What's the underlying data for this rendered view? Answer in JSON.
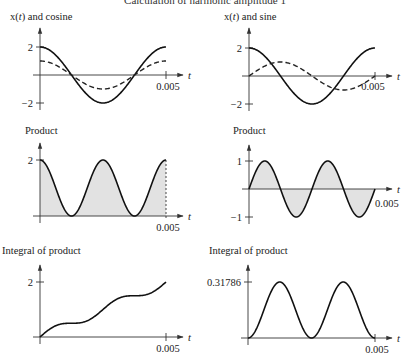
{
  "title": "Calculation of harmonic amplitude 1",
  "chart_data": [
    {
      "id": "xcos",
      "type": "line",
      "title": "x(t) and cosine",
      "xlabel": "t",
      "x_tick": "0.005",
      "y_ticks": [
        "2",
        "−2"
      ],
      "xlim": [
        0,
        0.005
      ],
      "ylim": [
        -2,
        2
      ],
      "series": [
        {
          "name": "x(t)",
          "style": "solid",
          "formula": "2cos(2πt/0.005)",
          "x": [
            0,
            0.00125,
            0.0025,
            0.00375,
            0.005
          ],
          "values": [
            2,
            0,
            -2,
            0,
            2
          ]
        },
        {
          "name": "cosine",
          "style": "dashed",
          "formula": "cos(2πt/0.005)",
          "x": [
            0,
            0.00125,
            0.0025,
            0.00375,
            0.005
          ],
          "values": [
            1,
            0,
            -1,
            0,
            1
          ]
        }
      ]
    },
    {
      "id": "xsin",
      "type": "line",
      "title": "x(t) and sine",
      "xlabel": "t",
      "x_tick": "0.005",
      "y_ticks": [
        "2",
        "−2"
      ],
      "xlim": [
        0,
        0.005
      ],
      "ylim": [
        -2,
        2
      ],
      "series": [
        {
          "name": "x(t)",
          "style": "solid",
          "formula": "2cos(2πt/0.005)",
          "x": [
            0,
            0.00125,
            0.0025,
            0.00375,
            0.005
          ],
          "values": [
            2,
            0,
            -2,
            0,
            2
          ]
        },
        {
          "name": "sine",
          "style": "dashed",
          "formula": "sin(2πt/0.005)",
          "x": [
            0,
            0.00125,
            0.0025,
            0.00375,
            0.005
          ],
          "values": [
            0,
            1,
            0,
            -1,
            0
          ]
        }
      ]
    },
    {
      "id": "prodcos",
      "type": "area",
      "title": "Product",
      "xlabel": "t",
      "x_tick": "0.005",
      "y_ticks": [
        "2"
      ],
      "xlim": [
        0,
        0.005
      ],
      "ylim": [
        0,
        2
      ],
      "series": [
        {
          "name": "x(t)·cosine",
          "formula": "2cos²(2πt/0.005)",
          "x": [
            0,
            0.00125,
            0.0025,
            0.00375,
            0.005
          ],
          "values": [
            2,
            0,
            2,
            0,
            2
          ]
        }
      ]
    },
    {
      "id": "prodsin",
      "type": "area",
      "title": "Product",
      "xlabel": "t",
      "x_tick": "0.005",
      "y_ticks": [
        "1",
        "−1"
      ],
      "xlim": [
        0,
        0.005
      ],
      "ylim": [
        -1,
        1
      ],
      "series": [
        {
          "name": "x(t)·sine",
          "formula": "sin(4πt/0.005)",
          "x": [
            0,
            0.000625,
            0.00125,
            0.001875,
            0.0025,
            0.003125,
            0.00375,
            0.004375,
            0.005
          ],
          "values": [
            0,
            1,
            0,
            -1,
            0,
            1,
            0,
            -1,
            0
          ]
        }
      ]
    },
    {
      "id": "intcos",
      "type": "line",
      "title": "Integral of product",
      "xlabel": "t",
      "x_tick": "0.005",
      "y_ticks": [
        "2"
      ],
      "xlim": [
        0,
        0.005
      ],
      "ylim": [
        0,
        2
      ],
      "series": [
        {
          "name": "integral",
          "formula": "t/T·2 + sin(4πt/T)/(2π) (normalized)",
          "x": [
            0,
            0.00125,
            0.0025,
            0.00375,
            0.005
          ],
          "values": [
            0,
            0.5,
            1,
            1.5,
            2
          ]
        }
      ]
    },
    {
      "id": "intsin",
      "type": "line",
      "title": "Integral of product",
      "xlabel": "t",
      "x_tick": "0.005",
      "y_ticks": [
        "0.31786"
      ],
      "xlim": [
        0,
        0.005
      ],
      "ylim": [
        0,
        0.31786
      ],
      "series": [
        {
          "name": "integral",
          "formula": "(1 - cos(4πt/T))/2 scaled",
          "x": [
            0,
            0.00125,
            0.0025,
            0.00375,
            0.005
          ],
          "values": [
            0,
            0.31786,
            0,
            0.31786,
            0
          ]
        }
      ]
    }
  ]
}
